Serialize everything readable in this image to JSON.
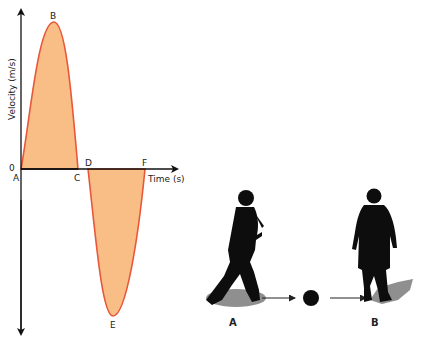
{
  "graph": {
    "y_axis_label": "Velocity (m/s)",
    "x_axis_label": "Time (s)",
    "origin_label": "0",
    "points": {
      "A": "A",
      "B": "B",
      "C": "C",
      "D": "D",
      "E": "E",
      "F": "F"
    },
    "colors": {
      "curve": "#e8573a",
      "fill": "#f8be86",
      "axis": "#111111"
    }
  },
  "illustration": {
    "player_a_label": "A",
    "player_b_label": "B",
    "colors": {
      "silhouette": "#0d0d0d",
      "shadow": "#8f8f8f"
    }
  }
}
